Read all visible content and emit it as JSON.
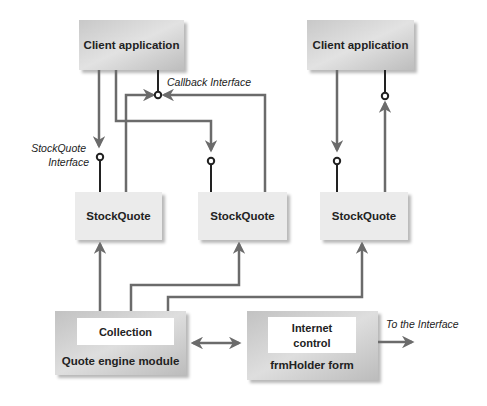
{
  "diagram": {
    "client_apps": [
      {
        "label": "Client application"
      },
      {
        "label": "Client application"
      }
    ],
    "stockquotes": [
      {
        "label": "StockQuote"
      },
      {
        "label": "StockQuote"
      },
      {
        "label": "StockQuote"
      }
    ],
    "quote_engine": {
      "inner_label": "Collection",
      "label": "Quote engine module"
    },
    "frm_holder": {
      "inner_label_line1": "Internet",
      "inner_label_line2": "control",
      "label": "frmHolder form"
    },
    "annotations": {
      "callback_interface": "Callback Interface",
      "stockquote_interface_line1": "StockQuote",
      "stockquote_interface_line2": "Interface",
      "to_interface": "To the Interface"
    },
    "colors": {
      "box_fill_dark": "#c4c4c4",
      "box_fill_light": "#e6e6e6",
      "box_fill_pale": "#ececec",
      "connector": "#6b6b6b",
      "interface_line": "#222222"
    }
  }
}
